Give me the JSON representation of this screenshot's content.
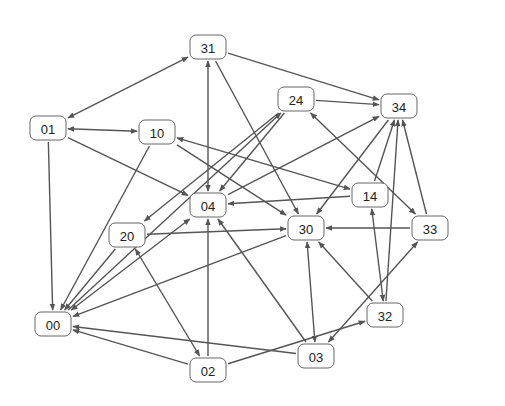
{
  "diagram": {
    "type": "directed-graph",
    "node_size": {
      "w": 36,
      "h": 24,
      "r": 6
    },
    "colors": {
      "edge": "#555555",
      "node_border": "#666666",
      "node_fill": "#ffffff",
      "text": "#222222"
    },
    "nodes": [
      {
        "id": "31",
        "label": "31",
        "x": 208,
        "y": 47
      },
      {
        "id": "01",
        "label": "01",
        "x": 48,
        "y": 128
      },
      {
        "id": "10",
        "label": "10",
        "x": 157,
        "y": 132
      },
      {
        "id": "24",
        "label": "24",
        "x": 296,
        "y": 99
      },
      {
        "id": "34",
        "label": "34",
        "x": 399,
        "y": 106
      },
      {
        "id": "04",
        "label": "04",
        "x": 208,
        "y": 205
      },
      {
        "id": "14",
        "label": "14",
        "x": 370,
        "y": 195
      },
      {
        "id": "20",
        "label": "20",
        "x": 127,
        "y": 235
      },
      {
        "id": "30",
        "label": "30",
        "x": 306,
        "y": 228
      },
      {
        "id": "33",
        "label": "33",
        "x": 430,
        "y": 228
      },
      {
        "id": "00",
        "label": "00",
        "x": 53,
        "y": 324
      },
      {
        "id": "32",
        "label": "32",
        "x": 385,
        "y": 315
      },
      {
        "id": "03",
        "label": "03",
        "x": 316,
        "y": 356
      },
      {
        "id": "02",
        "label": "02",
        "x": 208,
        "y": 370
      }
    ],
    "edges": [
      {
        "from": "31",
        "to": "01",
        "both": true
      },
      {
        "from": "31",
        "to": "04",
        "both": true
      },
      {
        "from": "31",
        "to": "30",
        "both": false
      },
      {
        "from": "31",
        "to": "34",
        "both": false
      },
      {
        "from": "01",
        "to": "10",
        "both": true
      },
      {
        "from": "01",
        "to": "04",
        "both": false
      },
      {
        "from": "01",
        "to": "00",
        "both": false
      },
      {
        "from": "10",
        "to": "00",
        "both": false
      },
      {
        "from": "10",
        "to": "30",
        "both": false
      },
      {
        "from": "10",
        "to": "14",
        "both": true
      },
      {
        "from": "24",
        "to": "34",
        "both": false
      },
      {
        "from": "24",
        "to": "04",
        "both": false
      },
      {
        "from": "24",
        "to": "20",
        "both": false
      },
      {
        "from": "00",
        "to": "24",
        "both": false
      },
      {
        "from": "24",
        "to": "33",
        "both": true
      },
      {
        "from": "14",
        "to": "04",
        "both": false
      },
      {
        "from": "14",
        "to": "34",
        "both": false
      },
      {
        "from": "04",
        "to": "34",
        "both": false
      },
      {
        "from": "34",
        "to": "30",
        "both": false
      },
      {
        "from": "20",
        "to": "30",
        "both": false
      },
      {
        "from": "20",
        "to": "00",
        "both": false
      },
      {
        "from": "20",
        "to": "02",
        "both": true
      },
      {
        "from": "00",
        "to": "04",
        "both": true
      },
      {
        "from": "30",
        "to": "00",
        "both": false
      },
      {
        "from": "33",
        "to": "30",
        "both": false
      },
      {
        "from": "33",
        "to": "34",
        "both": false
      },
      {
        "from": "32",
        "to": "34",
        "both": false
      },
      {
        "from": "32",
        "to": "14",
        "both": true
      },
      {
        "from": "32",
        "to": "30",
        "both": false
      },
      {
        "from": "02",
        "to": "32",
        "both": false
      },
      {
        "from": "03",
        "to": "33",
        "both": true
      },
      {
        "from": "30",
        "to": "03",
        "both": true
      },
      {
        "from": "03",
        "to": "04",
        "both": false
      },
      {
        "from": "03",
        "to": "00",
        "both": false
      },
      {
        "from": "02",
        "to": "04",
        "both": false
      },
      {
        "from": "02",
        "to": "00",
        "both": false
      }
    ]
  }
}
